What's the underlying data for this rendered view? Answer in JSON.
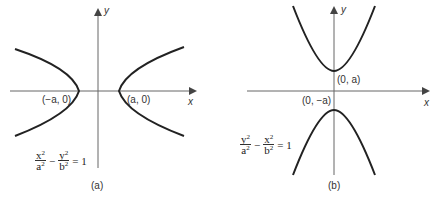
{
  "figure": {
    "panel_a": {
      "caption": "(a)",
      "x_axis_label": "x",
      "y_axis_label": "y",
      "vertex_left_label": "(−a, 0)",
      "vertex_right_label": "(a, 0)",
      "equation": {
        "term1_num": "x",
        "term1_den": "a",
        "term2_num": "y",
        "term2_den": "b",
        "exponent": "2",
        "operator": "−",
        "rhs": "= 1"
      },
      "orientation": "horizontal transverse axis"
    },
    "panel_b": {
      "caption": "(b)",
      "x_axis_label": "x",
      "y_axis_label": "y",
      "vertex_top_label": "(0, a)",
      "vertex_bottom_label": "(0, −a)",
      "equation": {
        "term1_num": "y",
        "term1_den": "a",
        "term2_num": "x",
        "term2_den": "b",
        "exponent": "2",
        "operator": "−",
        "rhs": "= 1"
      },
      "orientation": "vertical transverse axis"
    },
    "colors": {
      "curve": "#222222",
      "axis": "#555555",
      "text": "#333333"
    }
  }
}
